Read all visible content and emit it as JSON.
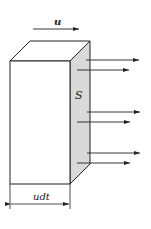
{
  "diagram": {
    "labels": {
      "velocity": "u",
      "surface": "S",
      "length": "udt"
    },
    "colors": {
      "stroke": "#222222",
      "shaded_face": "#d9d9d9",
      "background": "#ffffff"
    },
    "prism": {
      "front": {
        "x": 10,
        "y": 61,
        "w": 60,
        "h": 123
      },
      "depth_offset": {
        "dx": 20,
        "dy": -20
      }
    },
    "arrows": [
      {
        "x1": 86,
        "y1": 60,
        "x2": 139,
        "y2": 60
      },
      {
        "x1": 77,
        "y1": 70,
        "x2": 129,
        "y2": 70
      },
      {
        "x1": 87,
        "y1": 112,
        "x2": 140,
        "y2": 112
      },
      {
        "x1": 77,
        "y1": 122,
        "x2": 130,
        "y2": 122
      },
      {
        "x1": 87,
        "y1": 153,
        "x2": 140,
        "y2": 153
      },
      {
        "x1": 77,
        "y1": 163,
        "x2": 130,
        "y2": 163
      }
    ]
  }
}
